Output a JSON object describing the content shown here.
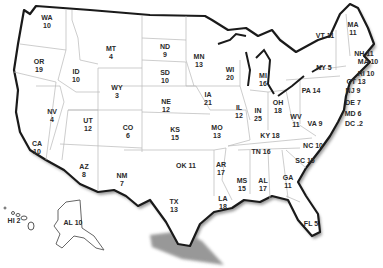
{
  "map": {
    "title": "",
    "states": [
      {
        "abbr": "WA",
        "value": "10",
        "x": 47,
        "y": 14,
        "inline": false
      },
      {
        "abbr": "OR",
        "value": "19",
        "x": 39,
        "y": 58,
        "inline": false
      },
      {
        "abbr": "ID",
        "value": "10",
        "x": 76,
        "y": 68,
        "inline": false
      },
      {
        "abbr": "MT",
        "value": "4",
        "x": 111,
        "y": 45,
        "inline": false
      },
      {
        "abbr": "WY",
        "value": "3",
        "x": 117,
        "y": 84,
        "inline": false
      },
      {
        "abbr": "NV",
        "value": "4",
        "x": 52,
        "y": 108,
        "inline": false
      },
      {
        "abbr": "UT",
        "value": "12",
        "x": 88,
        "y": 117,
        "inline": false
      },
      {
        "abbr": "CO",
        "value": "6",
        "x": 128,
        "y": 124,
        "inline": false
      },
      {
        "abbr": "CA",
        "value": "10",
        "x": 37,
        "y": 140,
        "inline": false
      },
      {
        "abbr": "AZ",
        "value": "8",
        "x": 84,
        "y": 163,
        "inline": false
      },
      {
        "abbr": "NM",
        "value": "7",
        "x": 122,
        "y": 172,
        "inline": false
      },
      {
        "abbr": "ND",
        "value": "9",
        "x": 165,
        "y": 43,
        "inline": false
      },
      {
        "abbr": "SD",
        "value": "10",
        "x": 165,
        "y": 69,
        "inline": false
      },
      {
        "abbr": "NE",
        "value": "12",
        "x": 166,
        "y": 98,
        "inline": false
      },
      {
        "abbr": "KS",
        "value": "15",
        "x": 175,
        "y": 126,
        "inline": false
      },
      {
        "abbr": "OK",
        "value": "11",
        "x": 186,
        "y": 162,
        "inline": true
      },
      {
        "abbr": "TX",
        "value": "13",
        "x": 174,
        "y": 198,
        "inline": false
      },
      {
        "abbr": "MN",
        "value": "13",
        "x": 199,
        "y": 53,
        "inline": false
      },
      {
        "abbr": "IA",
        "value": "21",
        "x": 208,
        "y": 91,
        "inline": false
      },
      {
        "abbr": "MO",
        "value": "13",
        "x": 217,
        "y": 124,
        "inline": false
      },
      {
        "abbr": "AR",
        "value": "17",
        "x": 221,
        "y": 161,
        "inline": false
      },
      {
        "abbr": "LA",
        "value": "18",
        "x": 223,
        "y": 195,
        "inline": false
      },
      {
        "abbr": "WI",
        "value": "20",
        "x": 230,
        "y": 66,
        "inline": false
      },
      {
        "abbr": "IL",
        "value": "12",
        "x": 239,
        "y": 104,
        "inline": false
      },
      {
        "abbr": "MI",
        "value": "16",
        "x": 263,
        "y": 72,
        "inline": false
      },
      {
        "abbr": "IN",
        "value": "25",
        "x": 258,
        "y": 107,
        "inline": false
      },
      {
        "abbr": "OH",
        "value": "18",
        "x": 278,
        "y": 99,
        "inline": false
      },
      {
        "abbr": "KY",
        "value": "18",
        "x": 270,
        "y": 132,
        "inline": true
      },
      {
        "abbr": "TN",
        "value": "16",
        "x": 261,
        "y": 148,
        "inline": true
      },
      {
        "abbr": "MS",
        "value": "15",
        "x": 242,
        "y": 177,
        "inline": false
      },
      {
        "abbr": "AL",
        "value": "17",
        "x": 263,
        "y": 177,
        "inline": false
      },
      {
        "abbr": "GA",
        "value": "11",
        "x": 288,
        "y": 174,
        "inline": false
      },
      {
        "abbr": "WV",
        "value": "11",
        "x": 296,
        "y": 113,
        "inline": false
      },
      {
        "abbr": "VA",
        "value": "9",
        "x": 315,
        "y": 120,
        "inline": true
      },
      {
        "abbr": "NC",
        "value": "10",
        "x": 313,
        "y": 142,
        "inline": true
      },
      {
        "abbr": "SC",
        "value": "15",
        "x": 305,
        "y": 157,
        "inline": true
      },
      {
        "abbr": "FL",
        "value": "5",
        "x": 311,
        "y": 220,
        "inline": true
      },
      {
        "abbr": "PA",
        "value": "14",
        "x": 311,
        "y": 87,
        "inline": true
      },
      {
        "abbr": "NY",
        "value": "5",
        "x": 324,
        "y": 64,
        "inline": true
      },
      {
        "abbr": "VT",
        "value": "11",
        "x": 325,
        "y": 32,
        "inline": true
      },
      {
        "abbr": "MA",
        "value": "11",
        "x": 353,
        "y": 21,
        "inline": false
      },
      {
        "abbr": "NH",
        "value": "11",
        "x": 364,
        "y": 50,
        "inline": true
      },
      {
        "abbr": "MA",
        "value": "10",
        "x": 368,
        "y": 58,
        "inline": true
      },
      {
        "abbr": "RI",
        "value": "10",
        "x": 366,
        "y": 70,
        "inline": true
      },
      {
        "abbr": "CT",
        "value": "13",
        "x": 356,
        "y": 78,
        "inline": true
      },
      {
        "abbr": "NJ",
        "value": "9",
        "x": 353,
        "y": 87,
        "inline": true
      },
      {
        "abbr": "DE",
        "value": "7",
        "x": 353,
        "y": 99,
        "inline": true
      },
      {
        "abbr": "MD",
        "value": "6",
        "x": 353,
        "y": 110,
        "inline": true
      },
      {
        "abbr": "DC",
        "value": ".2",
        "x": 354,
        "y": 120,
        "inline": true
      },
      {
        "abbr": "HI",
        "value": "2",
        "x": 14,
        "y": 217,
        "inline": true
      },
      {
        "abbr": "AL",
        "value": "10",
        "x": 73,
        "y": 219,
        "inline": true
      }
    ]
  },
  "colors": {
    "border": "#1a1a1a",
    "state_line": "#b8b8b8",
    "fill": "#ffffff",
    "shadow": "#888888",
    "text": "#2a2a2a"
  }
}
